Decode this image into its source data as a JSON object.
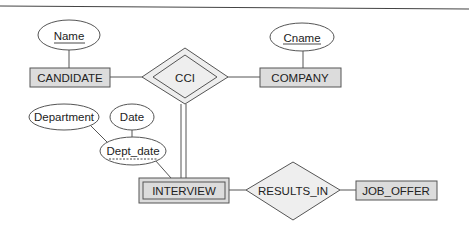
{
  "diagram": {
    "type": "ER diagram",
    "entities": [
      {
        "id": "candidate",
        "label": "CANDIDATE",
        "weak": false
      },
      {
        "id": "company",
        "label": "COMPANY",
        "weak": false
      },
      {
        "id": "interview",
        "label": "INTERVIEW",
        "weak": true
      },
      {
        "id": "job_offer",
        "label": "JOB_OFFER",
        "weak": false
      }
    ],
    "relationships": [
      {
        "id": "cci",
        "label": "CCI",
        "identifying": true
      },
      {
        "id": "results_in",
        "label": "RESULTS_IN",
        "identifying": false
      }
    ],
    "attributes": [
      {
        "id": "name",
        "label": "Name",
        "key": true,
        "owner": "CANDIDATE"
      },
      {
        "id": "cname",
        "label": "Cname",
        "key": true,
        "owner": "COMPANY"
      },
      {
        "id": "department",
        "label": "Department",
        "key": false,
        "owner": "Dept_date"
      },
      {
        "id": "date",
        "label": "Date",
        "key": false,
        "owner": "Dept_date"
      },
      {
        "id": "dept_date",
        "label": "Dept_date",
        "partial_key": true,
        "composite": true,
        "owner": "INTERVIEW"
      }
    ],
    "edges": [
      [
        "Name",
        "CANDIDATE"
      ],
      [
        "Cname",
        "COMPANY"
      ],
      [
        "CANDIDATE",
        "CCI"
      ],
      [
        "CCI",
        "COMPANY"
      ],
      [
        "CCI",
        "INTERVIEW (double line)"
      ],
      [
        "Department",
        "Dept_date"
      ],
      [
        "Date",
        "Dept_date"
      ],
      [
        "Dept_date",
        "INTERVIEW"
      ],
      [
        "INTERVIEW",
        "RESULTS_IN"
      ],
      [
        "RESULTS_IN",
        "JOB_OFFER"
      ]
    ],
    "colors": {
      "entity_fill": "#dcdcdc",
      "relationship_fill": "#eeeeee",
      "stroke": "#555555",
      "rule": "#444444"
    }
  }
}
